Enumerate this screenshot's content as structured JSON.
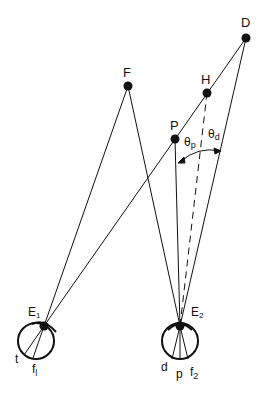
{
  "diagram": {
    "type": "binocular-geometry",
    "points": {
      "D": {
        "label": "D",
        "x": 246,
        "y": 38
      },
      "F": {
        "label": "F",
        "x": 128,
        "y": 86
      },
      "H": {
        "label": "H",
        "x": 207,
        "y": 93
      },
      "P": {
        "label": "P",
        "x": 175,
        "y": 139
      }
    },
    "eyes": {
      "left": {
        "label": "E",
        "sub": "1",
        "node_x": 44,
        "node_y": 326,
        "cx": 36,
        "cy": 341,
        "r": 18,
        "retina_labels": [
          {
            "text": "t",
            "sub": ""
          },
          {
            "text": "f",
            "sub": "l"
          }
        ]
      },
      "right": {
        "label": "E",
        "sub": "2",
        "node_x": 180,
        "node_y": 326,
        "cx": 180,
        "cy": 341,
        "r": 18,
        "retina_labels": [
          {
            "text": "d",
            "sub": ""
          },
          {
            "text": "p",
            "sub": ""
          },
          {
            "text": "f",
            "sub": "2"
          }
        ]
      }
    },
    "angles": {
      "theta_p": {
        "symbol": "θ",
        "sub": "p"
      },
      "theta_d": {
        "symbol": "θ",
        "sub": "d"
      }
    },
    "colors": {
      "line": "#111111",
      "background": "#ffffff"
    }
  }
}
